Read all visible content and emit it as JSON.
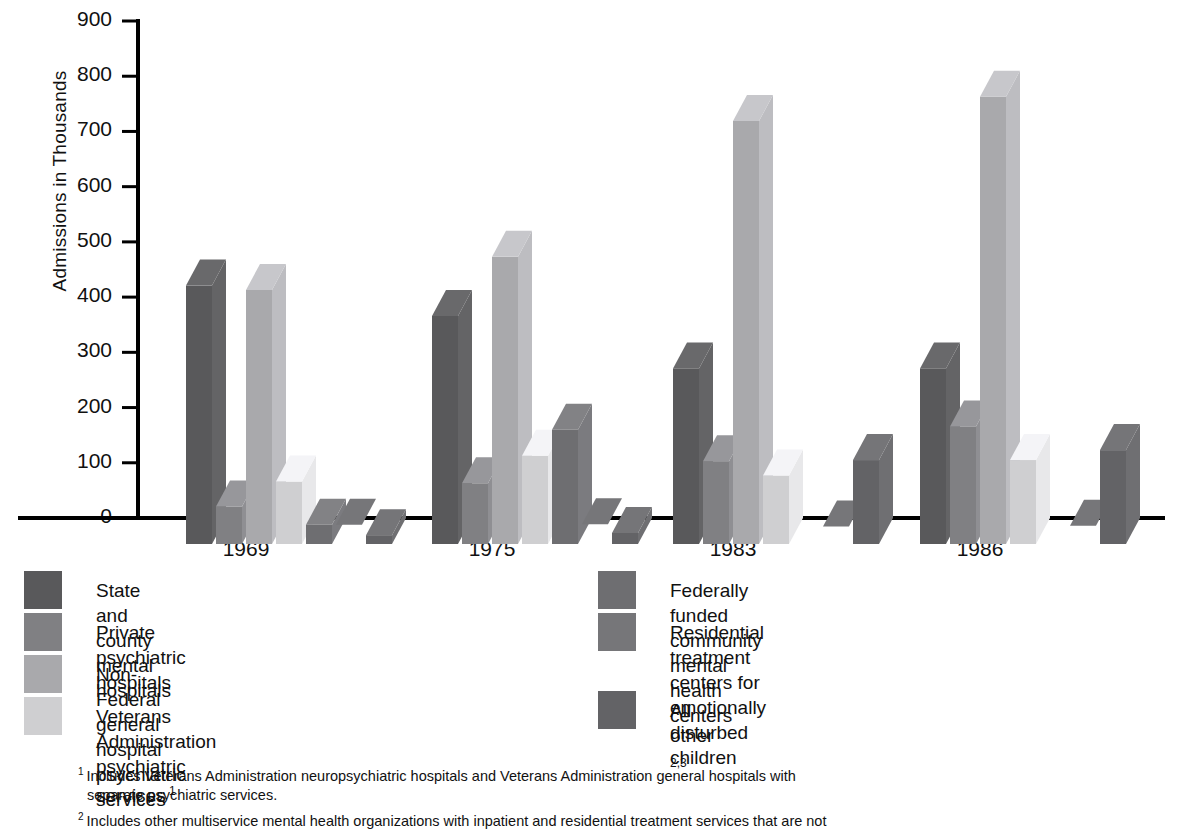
{
  "axes": {
    "ylabel": "Admissions in Thousands",
    "yticks": [
      0,
      100,
      200,
      300,
      400,
      500,
      600,
      700,
      800,
      900
    ],
    "ylim": [
      0,
      900
    ],
    "xticks": [
      "1969",
      "1975",
      "1983",
      "1986"
    ]
  },
  "legend": {
    "left": [
      {
        "label": "State and county mental hospitals",
        "color": "#59595b",
        "sup": ""
      },
      {
        "label": "Private psychiatric hospitals",
        "color": "#808083",
        "sup": ""
      },
      {
        "label": "Non-Federal general hospital psychiatric services",
        "color": "#a9a9ac",
        "sup": ""
      },
      {
        "label": "Veterans Administration psychiatric services",
        "color": "#cfcfd1",
        "sup": "1"
      }
    ],
    "right": [
      {
        "label": "Federally funded community mental health centers",
        "color": "#6e6e71",
        "sup": ""
      },
      {
        "label": "Residential treatment centers for\nemotionally disturbed children",
        "color": "#767679",
        "sup": ""
      },
      {
        "label": "All other",
        "color": "#636366",
        "sup": "2,3"
      }
    ]
  },
  "footnotes": [
    {
      "marker": "1",
      "text": "Includes Veterans Administration neuropsychiatric hospitals and Veterans Administration general hospitals with",
      "cont": "separate psychiatric services."
    },
    {
      "marker": "2",
      "text": "Includes other multiservice mental health organizations with inpatient and residential treatment services that are not",
      "cont": ""
    }
  ],
  "chart_data": {
    "type": "bar",
    "title": "",
    "xlabel": "",
    "ylabel": "Admissions in Thousands",
    "ylim": [
      0,
      900
    ],
    "grid": false,
    "legend_position": "below",
    "categories": [
      "1969",
      "1975",
      "1983",
      "1986"
    ],
    "series": [
      {
        "name": "State and county mental hospitals",
        "color": "#59595b",
        "values": [
          468,
          413,
          318,
          318
        ]
      },
      {
        "name": "Private psychiatric hospitals",
        "color": "#808083",
        "values": [
          68,
          110,
          150,
          213
        ]
      },
      {
        "name": "Non-Federal general hospital psychiatric services",
        "color": "#a9a9ac",
        "values": [
          460,
          520,
          766,
          810
        ]
      },
      {
        "name": "Veterans Administration psychiatric services",
        "color": "#cfcfd1",
        "values": [
          113,
          160,
          124,
          152
        ]
      },
      {
        "name": "Federally funded community mental health centers",
        "color": "#6e6e71",
        "values": [
          35,
          207,
          0,
          0
        ]
      },
      {
        "name": "Residential treatment centers for emotionally disturbed children",
        "color": "#767679",
        "values": [
          -5,
          -4,
          -8,
          -7
        ]
      },
      {
        "name": "All other",
        "color": "#636366",
        "values": [
          16,
          20,
          152,
          170
        ]
      }
    ]
  }
}
